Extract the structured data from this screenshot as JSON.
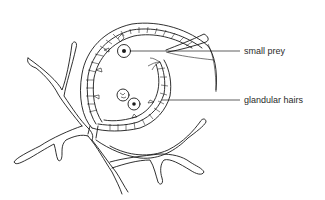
{
  "diagram": {
    "labels": [
      {
        "id": "small-prey",
        "text": "small prey",
        "x": 244,
        "y": 52
      },
      {
        "id": "glandular-hairs",
        "text": "glandular hairs",
        "x": 244,
        "y": 101
      }
    ],
    "colors": {
      "line": "#1a1a1a",
      "text": "#2a2a2a",
      "background": "#ffffff"
    }
  }
}
